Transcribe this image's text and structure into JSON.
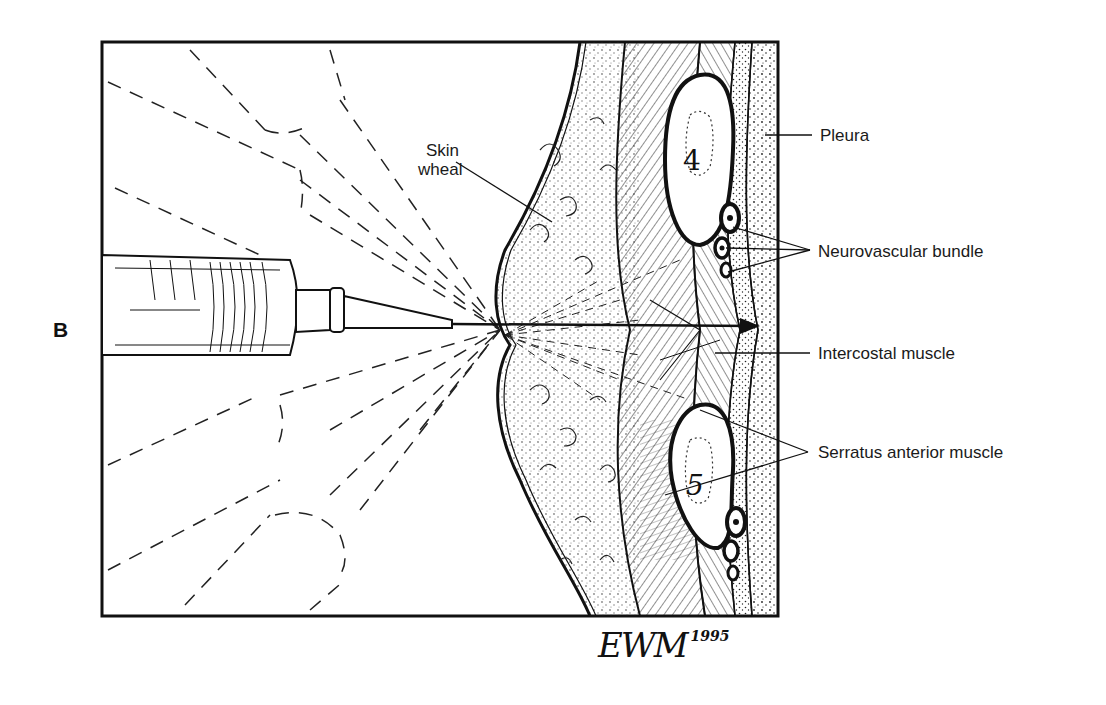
{
  "figure": {
    "panel_letter": "B",
    "labels": {
      "skin_wheal_line1": "Skin",
      "skin_wheal_line2": "wheal",
      "pleura": "Pleura",
      "neurovascular_bundle": "Neurovascular bundle",
      "intercostal_muscle": "Intercostal muscle",
      "serratus_anterior_muscle": "Serratus anterior muscle"
    },
    "rib_numbers": {
      "upper": "4",
      "lower": "5"
    },
    "signature": {
      "initials": "EWM",
      "year": "1995"
    },
    "colors": {
      "ink": "#111111",
      "paper": "#ffffff"
    }
  }
}
